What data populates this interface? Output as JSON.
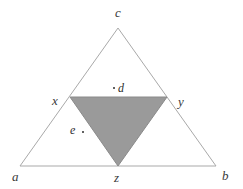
{
  "figure": {
    "background_color": "#ffffff",
    "outer_triangle": {
      "name": "triangle-abc",
      "stroke_color": "#a9a9a9",
      "stroke_width": 1,
      "fill": "none",
      "vertices": [
        {
          "id": "a",
          "label": "a",
          "x": 20,
          "y": 166
        },
        {
          "id": "b",
          "label": "b",
          "x": 216,
          "y": 166
        },
        {
          "id": "c",
          "label": "c",
          "x": 118,
          "y": 28
        }
      ]
    },
    "inner_triangle": {
      "name": "triangle-xyz",
      "fill_color": "#9a9a9a",
      "stroke_color": "#8a8a8a",
      "stroke_width": 1,
      "orientation": "inverted",
      "vertices": [
        {
          "id": "x",
          "label": "x",
          "x": 70,
          "y": 97
        },
        {
          "id": "y",
          "label": "y",
          "x": 167,
          "y": 97
        },
        {
          "id": "z",
          "label": "z",
          "x": 118,
          "y": 166
        }
      ]
    },
    "labels": [
      {
        "id": "label-c",
        "text": "c",
        "left": 115,
        "top": 6
      },
      {
        "id": "label-a",
        "text": "a",
        "left": 12,
        "top": 170
      },
      {
        "id": "label-b",
        "text": "b",
        "left": 222,
        "top": 169
      },
      {
        "id": "label-x",
        "text": "x",
        "left": 52,
        "top": 94
      },
      {
        "id": "label-y",
        "text": "y",
        "left": 178,
        "top": 95
      },
      {
        "id": "label-z",
        "text": "z",
        "left": 114,
        "top": 171
      }
    ],
    "interior_points": [
      {
        "id": "point-d",
        "text": "d",
        "dot_left": 113,
        "dot_top": 87,
        "label_left": 118,
        "label_top": 82,
        "region": "inside-outer-above-inner"
      },
      {
        "id": "point-e",
        "text": "e",
        "dot_left": 82,
        "dot_top": 131,
        "label_left": 70,
        "label_top": 124,
        "region": "inside-outer-outside-inner"
      }
    ]
  }
}
